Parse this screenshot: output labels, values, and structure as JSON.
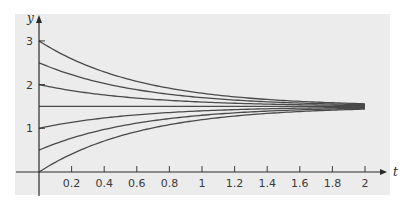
{
  "chart_data": {
    "type": "line",
    "title": "",
    "xlabel": "t",
    "ylabel": "y",
    "xlim": [
      0,
      2
    ],
    "ylim": [
      0,
      3
    ],
    "x_ticks": [
      "0.2",
      "0.4",
      "0.6",
      "0.8",
      "1",
      "1.2",
      "1.4",
      "1.6",
      "1.8",
      "2"
    ],
    "y_ticks": [
      "1",
      "2",
      "3"
    ],
    "grid": false,
    "legend": null,
    "equilibrium": 1.5,
    "model": "y = 1.5 + (y0 - 1.5) * exp(-1.6 t)",
    "series": [
      {
        "name": "y0=3",
        "y0": 3.0
      },
      {
        "name": "y0=2.5",
        "y0": 2.5
      },
      {
        "name": "y0=2",
        "y0": 2.0
      },
      {
        "name": "y0=1.5",
        "y0": 1.5
      },
      {
        "name": "y0=1",
        "y0": 1.0
      },
      {
        "name": "y0=0.5",
        "y0": 0.5
      },
      {
        "name": "y0=0",
        "y0": 0.0
      }
    ],
    "x": [
      0,
      0.2,
      0.4,
      0.6,
      0.8,
      1.0,
      1.2,
      1.4,
      1.6,
      1.8,
      2.0
    ],
    "colors": {
      "background": "#ececec",
      "line": "#4a4a4a",
      "axis": "#2a2a2a"
    }
  }
}
